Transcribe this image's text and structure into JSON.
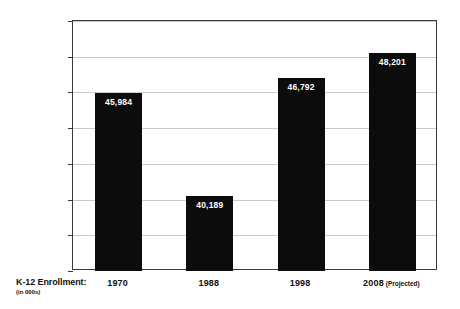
{
  "chart_data": {
    "type": "bar",
    "title": "",
    "xlabel": "",
    "ylabel": "",
    "categories": [
      "1970",
      "1988",
      "1998",
      "2008"
    ],
    "category_suffixes": [
      "",
      "",
      "",
      "(Projected)"
    ],
    "values": [
      45984,
      40189,
      46792,
      48201
    ],
    "value_labels": [
      "45,984",
      "40,189",
      "46,792",
      "48,201"
    ],
    "ylim": [
      36000,
      50000
    ],
    "ytick_step": 2000,
    "ytick_labels": [
      "36,000",
      "38,000",
      "40,000",
      "42,000",
      "44,000",
      "46,000",
      "48,000",
      "50,000"
    ],
    "ytick_values": [
      36000,
      38000,
      40000,
      42000,
      44000,
      46000,
      48000,
      50000
    ],
    "grid": true,
    "legend": "none",
    "series_caption": "K-12 Enrollment:",
    "series_caption_sub": "(in 000s)",
    "bar_color": "#0c0c0c",
    "grid_color": "#c9c9c9",
    "axis_color": "#3a3a3a",
    "label_text_color": "#ffffff",
    "background_color": "#ffffff"
  }
}
